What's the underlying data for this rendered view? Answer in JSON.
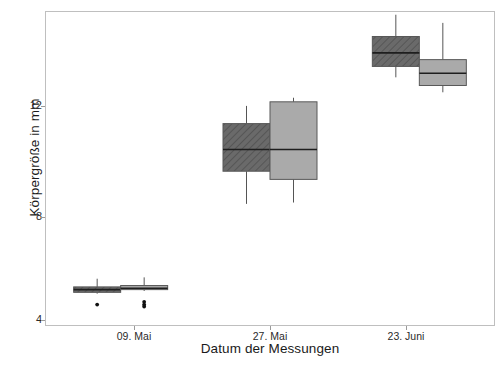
{
  "chart_data": {
    "type": "box",
    "title": "",
    "xlabel": "Datum der Messungen",
    "ylabel": "Körpergröße in mm",
    "categories": [
      "09. Mai",
      "27. Mai",
      "23. Juni"
    ],
    "ylim": [
      3.6,
      15.1
    ],
    "yticks": [
      4,
      8,
      12
    ],
    "ytick_labels": [
      "4",
      "8",
      "12"
    ],
    "grid": false,
    "legend": "none",
    "colors": {
      "series_a_fill": "#6a6a6a",
      "series_b_fill": "#aaaaaa",
      "outline": "#3a3a3a",
      "frame": "#bfbfbf",
      "background": "#ffffff",
      "text": "#1a1a1a"
    },
    "series": [
      {
        "name": "Gruppe A",
        "fill": "#6a6a6a",
        "hatch": "diagonal",
        "boxes": [
          {
            "category": "09. Mai",
            "whisker_low": 4.75,
            "q1": 4.8,
            "median": 4.9,
            "q3": 5.0,
            "whisker_high": 5.3,
            "outliers": [
              4.35
            ]
          },
          {
            "category": "27. Mai",
            "whisker_low": 8.05,
            "q1": 9.25,
            "median": 10.05,
            "q3": 11.0,
            "whisker_high": 11.65,
            "outliers": []
          },
          {
            "category": "23. Juni",
            "whisker_low": 12.7,
            "q1": 13.1,
            "median": 13.6,
            "q3": 14.2,
            "whisker_high": 15.0,
            "outliers": []
          }
        ]
      },
      {
        "name": "Gruppe B",
        "fill": "#aaaaaa",
        "hatch": "none",
        "boxes": [
          {
            "category": "09. Mai",
            "whisker_low": 4.85,
            "q1": 4.9,
            "median": 4.95,
            "q3": 5.05,
            "whisker_high": 5.35,
            "outliers": [
              4.45,
              4.35,
              4.28
            ]
          },
          {
            "category": "27. Mai",
            "whisker_low": 8.1,
            "q1": 8.95,
            "median": 10.05,
            "q3": 11.8,
            "whisker_high": 11.95,
            "outliers": []
          },
          {
            "category": "23. Juni",
            "whisker_low": 12.15,
            "q1": 12.4,
            "median": 12.85,
            "q3": 13.35,
            "whisker_high": 14.7,
            "outliers": []
          }
        ]
      }
    ]
  },
  "axes": {
    "y_title": "Körpergröße in mm",
    "x_title": "Datum der Messungen",
    "y_tick_0": "4",
    "y_tick_1": "8",
    "y_tick_2": "12",
    "x_tick_0": "09. Mai",
    "x_tick_1": "27. Mai",
    "x_tick_2": "23. Juni"
  }
}
